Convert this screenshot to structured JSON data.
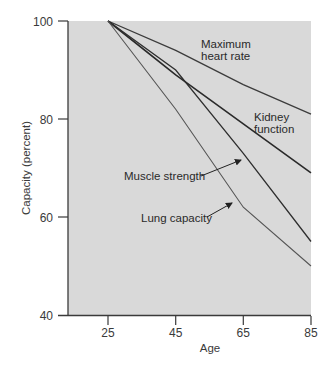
{
  "chart_data": {
    "type": "line",
    "title": "",
    "xlabel": "Age",
    "ylabel": "Capacity (percent)",
    "x": [
      25,
      45,
      65,
      85
    ],
    "xticks": [
      "25",
      "45",
      "65",
      "85"
    ],
    "yticks": [
      "40",
      "60",
      "80",
      "100"
    ],
    "xlim": [
      13,
      85
    ],
    "ylim": [
      40,
      100
    ],
    "grid": false,
    "legend": "inline labels",
    "background": "#d9d9d9",
    "series": [
      {
        "name": "Maximum heart rate",
        "label_lines": [
          "Maximum",
          "heart rate"
        ],
        "values": [
          100,
          94,
          87,
          81
        ],
        "color": "#3c3c3c"
      },
      {
        "name": "Kidney function",
        "label_lines": [
          "Kidney",
          "function"
        ],
        "values": [
          100,
          89,
          79,
          69
        ],
        "color": "#2a2a2a"
      },
      {
        "name": "Muscle strength",
        "label_lines": [
          "Muscle strength"
        ],
        "values": [
          100,
          90,
          73,
          55
        ],
        "color": "#2e2e2e"
      },
      {
        "name": "Lung capacity",
        "label_lines": [
          "Lung capacity"
        ],
        "values": [
          100,
          82,
          62,
          50
        ],
        "color": "#555555"
      }
    ]
  }
}
